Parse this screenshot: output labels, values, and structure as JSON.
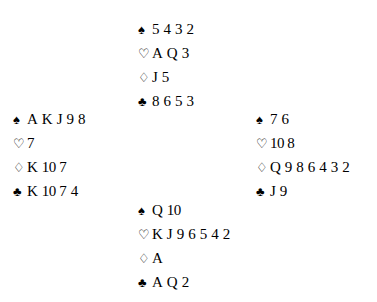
{
  "diagram": {
    "type": "bridge-deal",
    "background_color": "#ffffff",
    "text_color": "#000000"
  },
  "suits": {
    "spade": {
      "name": "spade-symbol",
      "glyph": "♠",
      "fill": "filled"
    },
    "heart": {
      "name": "heart-symbol",
      "glyph": "♡",
      "fill": "hollow"
    },
    "diamond": {
      "name": "diamond-symbol",
      "glyph": "♢",
      "fill": "hollow"
    },
    "club": {
      "name": "club-symbol",
      "glyph": "♣",
      "fill": "filled"
    }
  },
  "hands": {
    "north": {
      "position": "North",
      "spades": "5 4 3 2",
      "hearts": "A Q 3",
      "diamonds": "J 5",
      "clubs": "8 6 5 3"
    },
    "west": {
      "position": "West",
      "spades": "A K J 9 8",
      "hearts": "7",
      "diamonds": "K 10 7",
      "clubs": "K 10 7 4"
    },
    "east": {
      "position": "East",
      "spades": "7 6",
      "hearts": "10 8",
      "diamonds": "Q 9 8 6 4 3 2",
      "clubs": "J 9"
    },
    "south": {
      "position": "South",
      "spades": "Q 10",
      "hearts": "K J 9 6 5 4 2",
      "diamonds": "A",
      "clubs": "A Q 2"
    }
  }
}
